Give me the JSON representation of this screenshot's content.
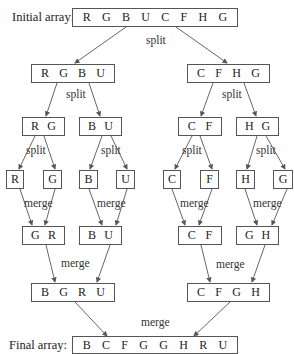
{
  "labels": {
    "initial": "Initial array:",
    "final": "Final array:",
    "split": "split",
    "merge": "merge"
  },
  "initial_array": [
    "R",
    "G",
    "B",
    "U",
    "C",
    "F",
    "H",
    "G"
  ],
  "split_level1": {
    "left": [
      "R",
      "G",
      "B",
      "U"
    ],
    "right": [
      "C",
      "F",
      "H",
      "G"
    ]
  },
  "split_level2": [
    [
      "R",
      "G"
    ],
    [
      "B",
      "U"
    ],
    [
      "C",
      "F"
    ],
    [
      "H",
      "G"
    ]
  ],
  "singles": [
    "R",
    "G",
    "B",
    "U",
    "C",
    "F",
    "H",
    "G"
  ],
  "merge_level1": [
    [
      "G",
      "R"
    ],
    [
      "B",
      "U"
    ],
    [
      "C",
      "F"
    ],
    [
      "G",
      "H"
    ]
  ],
  "merge_level2": {
    "left": [
      "B",
      "G",
      "R",
      "U"
    ],
    "right": [
      "C",
      "F",
      "G",
      "H"
    ]
  },
  "final_array": [
    "B",
    "C",
    "F",
    "G",
    "G",
    "H",
    "R",
    "U"
  ],
  "colors": {
    "line": "#555555",
    "text": "#222222",
    "background": "#ffffff"
  }
}
